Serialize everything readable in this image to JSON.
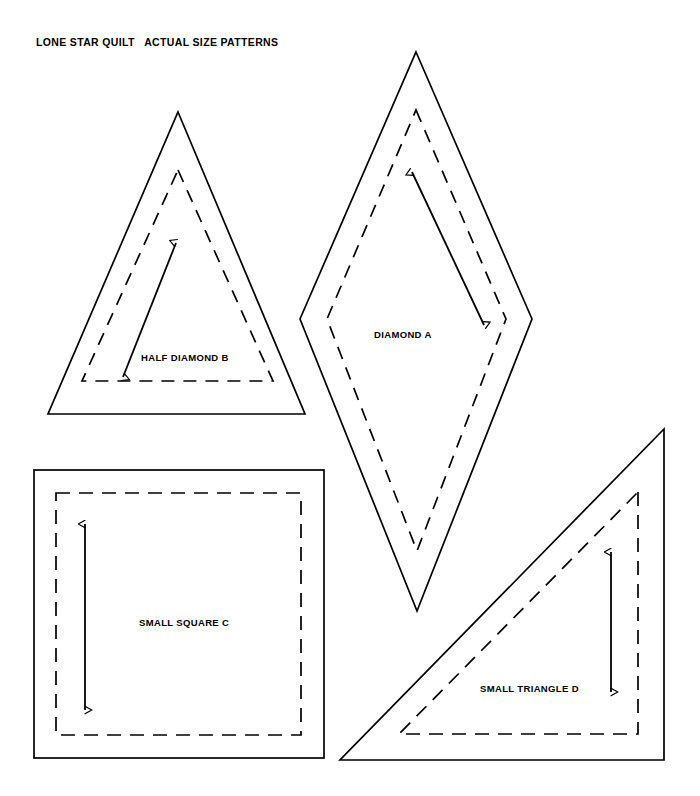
{
  "page": {
    "title": "LONE STAR QUILT   ACTUAL SIZE PATTERNS",
    "background_color": "#ffffff",
    "ink_color": "#000000",
    "width": 700,
    "height": 796
  },
  "patterns": [
    {
      "id": "half-diamond-b",
      "label": "HALF DIAMOND B",
      "shape": "triangle",
      "outline_style": "solid",
      "seam_line_style": "dashed",
      "grain_arrow": "double-headed-diagonal"
    },
    {
      "id": "diamond-a",
      "label": "DIAMOND A",
      "shape": "diamond",
      "outline_style": "solid",
      "seam_line_style": "dashed",
      "grain_arrow": "double-headed-diagonal"
    },
    {
      "id": "small-square-c",
      "label": "SMALL SQUARE C",
      "shape": "square",
      "outline_style": "solid",
      "seam_line_style": "dashed",
      "grain_arrow": "double-headed-vertical"
    },
    {
      "id": "small-triangle-d",
      "label": "SMALL TRIANGLE D",
      "shape": "right-triangle",
      "outline_style": "solid",
      "seam_line_style": "dashed",
      "grain_arrow": "double-headed-vertical"
    }
  ]
}
